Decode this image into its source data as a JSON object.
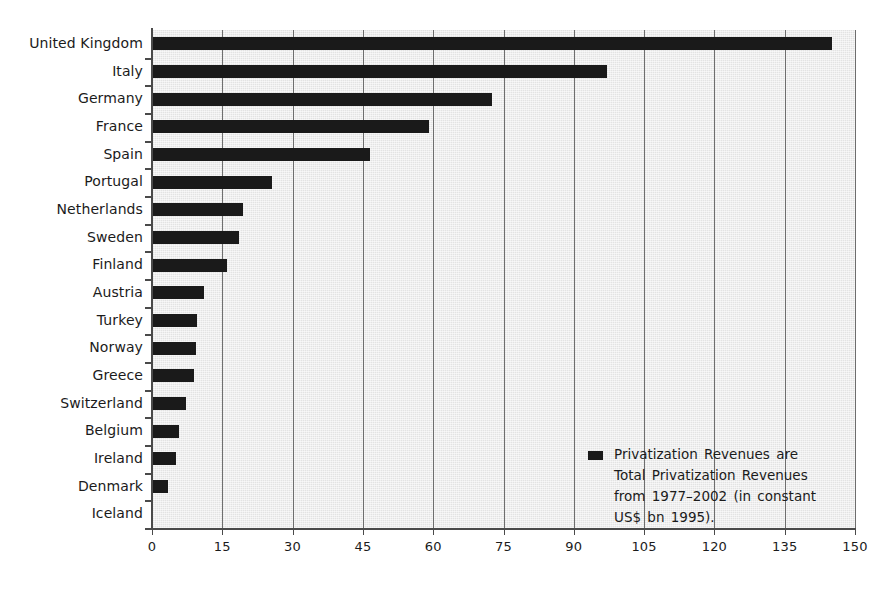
{
  "chart_data": {
    "type": "bar",
    "orientation": "horizontal",
    "title": "",
    "xlabel": "",
    "ylabel": "",
    "xlim": [
      0,
      150
    ],
    "ylim": null,
    "grid": true,
    "gridlines_axis": "x",
    "legend_position": "inside-bottom-right",
    "categories": [
      "United Kingdom",
      "Italy",
      "Germany",
      "France",
      "Spain",
      "Portugal",
      "Netherlands",
      "Sweden",
      "Finland",
      "Austria",
      "Turkey",
      "Norway",
      "Greece",
      "Switzerland",
      "Belgium",
      "Ireland",
      "Denmark",
      "Iceland"
    ],
    "values": [
      145,
      97,
      72.5,
      59,
      46.5,
      25.5,
      19.5,
      18.5,
      16,
      11,
      9.5,
      9.3,
      9,
      7.3,
      5.8,
      5.2,
      3.5,
      0
    ],
    "xticks": [
      0,
      15,
      30,
      45,
      60,
      75,
      90,
      105,
      120,
      135,
      150
    ],
    "xticklabels": [
      "0",
      "15",
      "30",
      "45",
      "60",
      "75",
      "90",
      "105",
      "120",
      "135",
      "150"
    ],
    "series": [
      {
        "name": "Privatization Revenues",
        "color": "#1a1a1a",
        "values": [
          145,
          97,
          72.5,
          59,
          46.5,
          25.5,
          19.5,
          18.5,
          16,
          11,
          9.5,
          9.3,
          9,
          7.3,
          5.8,
          5.2,
          3.5,
          0
        ]
      }
    ]
  },
  "legend": {
    "swatch_color": "#1a1a1a",
    "lines": [
      "Privatization Revenues are",
      "Total Privatization Revenues",
      "from 1977–2002 (in constant",
      "US$ bn 1995)."
    ]
  },
  "colors": {
    "bar": "#1a1a1a",
    "plot_background": "#e3e3e3",
    "gridline": "#6e6e6e",
    "axis": "#4a4a4a",
    "text": "#1b1b1b",
    "page_background": "#ffffff"
  }
}
